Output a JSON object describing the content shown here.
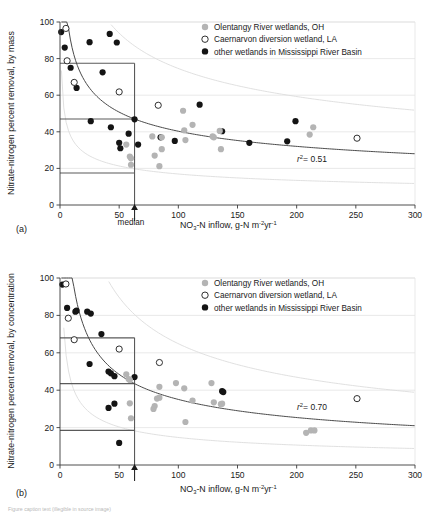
{
  "figure": {
    "caption_line": "Figure caption text (illegible in source image)"
  },
  "legend": {
    "items": [
      {
        "label": "Olentangy River wetlands, OH",
        "marker": "filled-gray-circle-icon",
        "color": "#b4b4b4"
      },
      {
        "label": "Caernarvon diversion wetland, LA",
        "marker": "open-circle-icon",
        "color": "#ffffff"
      },
      {
        "label": "other wetlands in Mississippi River Basin",
        "marker": "filled-black-circle-icon",
        "color": "#141414"
      }
    ]
  },
  "axis_common": {
    "xlabel_main": "NO",
    "xlabel_sub": "3",
    "xlabel_rest": "-N inflow, g-N m",
    "xlabel_sup1": "-2",
    "xlabel_mid": "yr",
    "xlabel_sup2": "-1",
    "xticks": [
      0,
      50,
      100,
      150,
      200,
      250,
      300
    ],
    "yticks": [
      0,
      20,
      40,
      60,
      80,
      100
    ],
    "median_label": "median",
    "median_value": 63
  },
  "chart_data": [
    {
      "type": "scatter",
      "panel": "(a)",
      "title": "",
      "xlabel": "NO3-N inflow, g-N m-2 yr-1",
      "ylabel": "Nitrate-nitrogen percent removal, by mass",
      "xlim": [
        0,
        300
      ],
      "ylim": [
        0,
        100
      ],
      "grid": true,
      "legend_position": "top-right",
      "annotation_r2": "r",
      "annotation_r2_sup": "2",
      "annotation_r2_val": "= 0.51",
      "r2": 0.51,
      "median_x": 63,
      "box_y_upper": 77.5,
      "box_y_median": 47,
      "box_y_lower": 17.5,
      "series": [
        {
          "name": "other wetlands in Mississippi River Basin",
          "style": "filled-black",
          "points": [
            [
              1,
              94.5
            ],
            [
              4,
              86
            ],
            [
              9,
              75
            ],
            [
              14,
              64
            ],
            [
              25,
              89
            ],
            [
              26,
              45.8
            ],
            [
              36,
              72.5
            ],
            [
              42,
              93.5
            ],
            [
              43,
              42.5
            ],
            [
              48,
              88.8
            ],
            [
              50,
              34
            ],
            [
              51,
              31
            ],
            [
              58,
              39
            ],
            [
              63,
              46.8
            ],
            [
              66,
              33
            ],
            [
              85,
              37
            ],
            [
              97,
              35
            ],
            [
              118,
              54.8
            ],
            [
              137,
              40.3
            ],
            [
              160,
              34
            ],
            [
              192,
              34.8
            ],
            [
              199,
              45.8
            ]
          ]
        },
        {
          "name": "Olentangy River wetlands, OH",
          "style": "filled-gray",
          "points": [
            [
              56,
              33
            ],
            [
              59,
              26.5
            ],
            [
              60,
              25.5
            ],
            [
              60,
              22
            ],
            [
              78,
              37.5
            ],
            [
              80,
              27
            ],
            [
              84,
              21.2
            ],
            [
              86,
              30.5
            ],
            [
              86,
              37
            ],
            [
              104,
              51.5
            ],
            [
              105,
              40.8
            ],
            [
              106,
              35.5
            ],
            [
              112,
              43.8
            ],
            [
              129,
              37.5
            ],
            [
              130,
              37
            ],
            [
              135,
              40.5
            ],
            [
              136,
              30.5
            ],
            [
              211,
              38.5
            ],
            [
              214,
              42.5
            ]
          ]
        },
        {
          "name": "Caernarvon diversion wetland, LA",
          "style": "open",
          "points": [
            [
              5,
              96.5
            ],
            [
              6,
              78.8
            ],
            [
              12,
              67
            ],
            [
              50,
              61.8
            ],
            [
              83,
              54.5
            ],
            [
              251,
              36.5
            ]
          ]
        }
      ]
    },
    {
      "type": "scatter",
      "panel": "(b)",
      "title": "",
      "xlabel": "NO3-N inflow, g-N m-2 yr-1",
      "ylabel": "Nitrate-nitrogen percent removal, by concentration",
      "xlim": [
        0,
        300
      ],
      "ylim": [
        0,
        100
      ],
      "grid": true,
      "legend_position": "top-right",
      "annotation_r2": "r",
      "annotation_r2_sup": "2",
      "annotation_r2_val": "= 0.70",
      "r2": 0.7,
      "median_x": 63,
      "box_y_upper": 68,
      "box_y_median": 43.5,
      "box_y_lower": 18.5,
      "series": [
        {
          "name": "other wetlands in Mississippi River Basin",
          "style": "filled-black",
          "points": [
            [
              2,
              96.5
            ],
            [
              6,
              84
            ],
            [
              13,
              82
            ],
            [
              14,
              82.5
            ],
            [
              23,
              82
            ],
            [
              26,
              81
            ],
            [
              25,
              54
            ],
            [
              35,
              70
            ],
            [
              41,
              50
            ],
            [
              43,
              49
            ],
            [
              46,
              47.5
            ],
            [
              41,
              30.5
            ],
            [
              46,
              32.8
            ],
            [
              63,
              47
            ],
            [
              50,
              11.8
            ],
            [
              137,
              39.5
            ],
            [
              138,
              39
            ]
          ]
        },
        {
          "name": "Olentangy River wetlands, OH",
          "style": "filled-gray",
          "points": [
            [
              56,
              48.5
            ],
            [
              58,
              46
            ],
            [
              59,
              45.5
            ],
            [
              59,
              33
            ],
            [
              60,
              25
            ],
            [
              79,
              30
            ],
            [
              80,
              31.5
            ],
            [
              82,
              35.5
            ],
            [
              84,
              36
            ],
            [
              84,
              41.8
            ],
            [
              98,
              43.8
            ],
            [
              105,
              41
            ],
            [
              106,
              23
            ],
            [
              112,
              34.5
            ],
            [
              128,
              43.8
            ],
            [
              130,
              33.5
            ],
            [
              136,
              32.5
            ],
            [
              137,
              32.8
            ],
            [
              208,
              17.2
            ],
            [
              212,
              18.5
            ],
            [
              215,
              18.5
            ]
          ]
        },
        {
          "name": "Caernarvon diversion wetland, LA",
          "style": "open",
          "points": [
            [
              5,
              96.8
            ],
            [
              7,
              78.5
            ],
            [
              12,
              67
            ],
            [
              50,
              62
            ],
            [
              84,
              54.8
            ],
            [
              251,
              35.5
            ]
          ]
        }
      ]
    }
  ]
}
